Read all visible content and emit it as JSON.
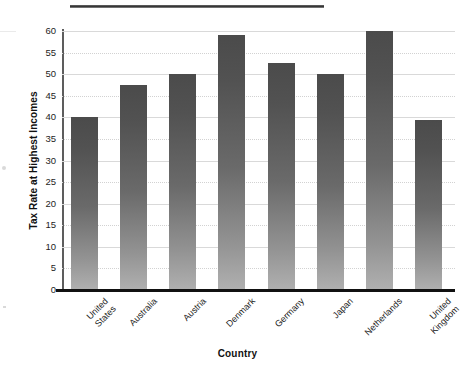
{
  "chart_data": {
    "type": "bar",
    "title": "",
    "xlabel": "Country",
    "ylabel": "Tax Rate at Highest Incomes",
    "categories": [
      "United\nStates",
      "Australia",
      "Austria",
      "Denmark",
      "Germany",
      "Japan",
      "Netherlands",
      "United\nKingdom"
    ],
    "values": [
      40,
      47.5,
      50,
      59,
      52.5,
      50,
      60,
      39.5
    ],
    "ylim": [
      0,
      60
    ],
    "yticks": [
      0,
      5,
      10,
      15,
      20,
      25,
      30,
      35,
      40,
      45,
      50,
      55,
      60
    ],
    "ytick_labels": [
      "0",
      "5",
      "10",
      "15",
      "20",
      "25",
      "30",
      "35",
      "40",
      "45",
      "50",
      "55",
      "60"
    ],
    "grid": true,
    "legend": "none",
    "bar_color_top": "#4b4b4b",
    "bar_color_bottom": "#b0b0b0",
    "axis_color": "#111111",
    "gridline_color": "#d9d9d9"
  },
  "figure": {
    "background": "#ffffff",
    "top_rule_color": "#2e2e2e"
  }
}
